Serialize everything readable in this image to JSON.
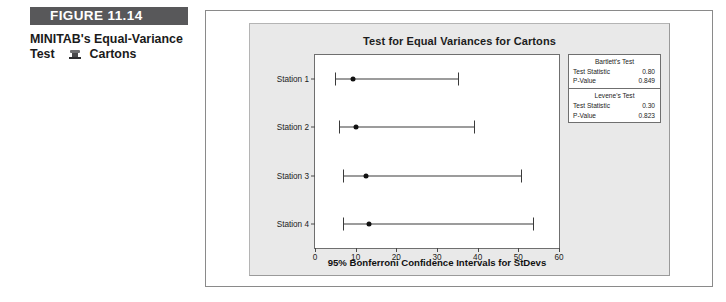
{
  "figure": {
    "header_label": "FIGURE 11.14",
    "caption_line1": "MINITAB's Equal-Variance",
    "caption_line2_prefix": "Test",
    "caption_line2_suffix": "Cartons",
    "caption_glyph": "degraded-glyph-icon"
  },
  "chart_data": {
    "type": "scatter",
    "title": "Test for Equal Variances for Cartons",
    "xlabel": "95% Bonferroni Confidence Intervals for StDevs",
    "ylabel": "",
    "xlim": [
      0,
      60
    ],
    "xticks": [
      0,
      10,
      20,
      30,
      40,
      50,
      60
    ],
    "xtick_labels": [
      "0",
      "10",
      "20",
      "30",
      "40",
      "50",
      "60"
    ],
    "categories": [
      "Station 1",
      "Station 2",
      "Station 3",
      "Station 4"
    ],
    "grid": false,
    "legend": "none",
    "series": [
      {
        "name": "95% Bonferroni CI for StDev",
        "points": [
          {
            "category": "Station 1",
            "estimate": 9.3,
            "lower": 5.0,
            "upper": 35.2
          },
          {
            "category": "Station 2",
            "estimate": 10.0,
            "lower": 5.9,
            "upper": 39.2
          },
          {
            "category": "Station 3",
            "estimate": 12.5,
            "lower": 7.0,
            "upper": 50.7
          },
          {
            "category": "Station 4",
            "estimate": 13.3,
            "lower": 7.0,
            "upper": 53.6
          }
        ]
      }
    ],
    "annotations": {
      "bartlett": {
        "title": "Bartlett's Test",
        "rows": [
          {
            "label": "Test Statistic",
            "value": "0.80"
          },
          {
            "label": "P-Value",
            "value": "0.849"
          }
        ]
      },
      "levene": {
        "title": "Levene's Test",
        "rows": [
          {
            "label": "Test Statistic",
            "value": "0.30"
          },
          {
            "label": "P-Value",
            "value": "0.823"
          }
        ]
      }
    }
  },
  "colors": {
    "header_bar": "#58585a",
    "panel_bg": "#e9e9e9",
    "plot_bg": "#ffffff",
    "marker": "#111111",
    "line": "#3a3a3a"
  }
}
